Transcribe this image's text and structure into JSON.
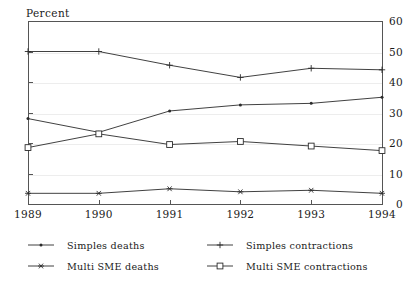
{
  "chart_data": {
    "type": "line",
    "title": "",
    "ylabel": "Percent",
    "xlabel": "",
    "x": [
      "1989",
      "1990",
      "1991",
      "1992",
      "1993",
      "1994"
    ],
    "categories": [
      "1989",
      "1990",
      "1991",
      "1992",
      "1993",
      "1994"
    ],
    "ylim": [
      0,
      60
    ],
    "yticks": [
      "0",
      "10",
      "20",
      "30",
      "40",
      "50",
      "60"
    ],
    "ytick_values": [
      0,
      10,
      20,
      30,
      40,
      50,
      60
    ],
    "grid": true,
    "legend_position": "below-plot-two-columns",
    "series": [
      {
        "name": "Simples deaths",
        "marker": "dot",
        "color": "#2b2b2b",
        "values": [
          28.0,
          23.5,
          30.5,
          32.5,
          33.0,
          35.0
        ]
      },
      {
        "name": "Simples contractions",
        "marker": "plus",
        "color": "#2b2b2b",
        "values": [
          50.0,
          50.0,
          45.5,
          41.5,
          44.5,
          44.0
        ]
      },
      {
        "name": "Multi SME deaths",
        "marker": "asterisk",
        "color": "#2b2b2b",
        "values": [
          3.5,
          3.5,
          5.0,
          4.0,
          4.5,
          3.5
        ]
      },
      {
        "name": "Multi SME contractions",
        "marker": "square",
        "color": "#2b2b2b",
        "values": [
          18.5,
          23.0,
          19.5,
          20.5,
          19.0,
          17.5
        ]
      }
    ]
  },
  "legend": {
    "items": [
      {
        "label": "Simples deaths",
        "marker": "dot"
      },
      {
        "label": "Simples contractions",
        "marker": "plus"
      },
      {
        "label": "Multi SME deaths",
        "marker": "asterisk"
      },
      {
        "label": "Multi SME contractions",
        "marker": "square"
      }
    ]
  },
  "colors": {
    "axis": "#555555",
    "grid": "#ededed",
    "line": "#2b2b2b",
    "background": "#ffffff",
    "text": "#1a1a1a"
  }
}
